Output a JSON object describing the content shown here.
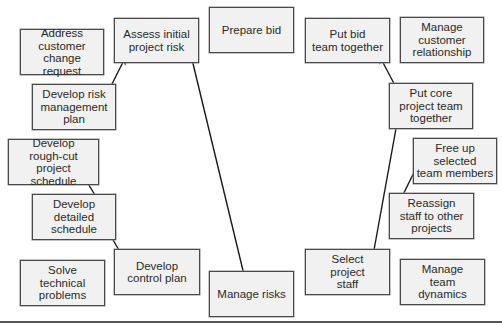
{
  "diagram": {
    "boxes": [
      {
        "id": "address-customer-change-request",
        "label": "Address\ncustomer\nchange request",
        "x": 20,
        "y": 29,
        "w": 84,
        "h": 46
      },
      {
        "id": "assess-initial-project-risk",
        "label": "Assess initial\nproject risk",
        "x": 114,
        "y": 18,
        "w": 85,
        "h": 45
      },
      {
        "id": "prepare-bid",
        "label": "Prepare bid",
        "x": 209,
        "y": 7,
        "w": 85,
        "h": 46
      },
      {
        "id": "put-bid-team-together",
        "label": "Put bid\nteam together",
        "x": 305,
        "y": 18,
        "w": 85,
        "h": 45
      },
      {
        "id": "manage-customer-relationship",
        "label": "Manage\ncustomer\nrelationship",
        "x": 400,
        "y": 17,
        "w": 84,
        "h": 46
      },
      {
        "id": "develop-risk-management-plan",
        "label": "Develop risk\nmanagement\nplan",
        "x": 32,
        "y": 84,
        "w": 84,
        "h": 46
      },
      {
        "id": "put-core-project-team-together",
        "label": "Put core\nproject  team\ntogether",
        "x": 389,
        "y": 83,
        "w": 84,
        "h": 46
      },
      {
        "id": "develop-rough-cut-project-schedule",
        "label": "Develop\nrough-cut project\nschedule",
        "x": 8,
        "y": 139,
        "w": 91,
        "h": 46
      },
      {
        "id": "free-up-selected-team-members",
        "label": "Free up\nselected\nteam members",
        "x": 413,
        "y": 138,
        "w": 84,
        "h": 46
      },
      {
        "id": "develop-detailed-schedule",
        "label": "Develop\ndetailed\nschedule",
        "x": 32,
        "y": 194,
        "w": 84,
        "h": 46
      },
      {
        "id": "reassign-staff-to-other-projects",
        "label": "Reassign\nstaff to other\nprojects",
        "x": 389,
        "y": 193,
        "w": 85,
        "h": 46
      },
      {
        "id": "solve-technical-problems",
        "label": "Solve\ntechnical\nproblems",
        "x": 20,
        "y": 260,
        "w": 85,
        "h": 46
      },
      {
        "id": "develop-control-plan",
        "label": "Develop\ncontrol plan",
        "x": 114,
        "y": 249,
        "w": 86,
        "h": 46
      },
      {
        "id": "manage-risks",
        "label": "Manage risks",
        "x": 209,
        "y": 271,
        "w": 85,
        "h": 46
      },
      {
        "id": "select-project-staff",
        "label": "Select\nproject\nstaff",
        "x": 305,
        "y": 249,
        "w": 85,
        "h": 46
      },
      {
        "id": "manage-team-dynamics",
        "label": "Manage\nteam\ndynamics",
        "x": 400,
        "y": 259,
        "w": 85,
        "h": 46
      }
    ],
    "connections": [
      {
        "from": "assess-initial-project-risk",
        "to": "develop-risk-management-plan",
        "type": "bidirectional"
      },
      {
        "from": "assess-initial-project-risk",
        "to": "manage-risks",
        "type": "bidirectional"
      },
      {
        "from": "develop-rough-cut-project-schedule",
        "to": "develop-detailed-schedule",
        "type": "bidirectional"
      },
      {
        "from": "develop-detailed-schedule",
        "to": "develop-control-plan",
        "type": "bidirectional"
      },
      {
        "from": "put-bid-team-together",
        "to": "put-core-project-team-together",
        "type": "bidirectional"
      },
      {
        "from": "put-core-project-team-together",
        "to": "select-project-staff",
        "type": "bidirectional"
      },
      {
        "from": "free-up-selected-team-members",
        "to": "reassign-staff-to-other-projects",
        "type": "bidirectional"
      }
    ]
  }
}
